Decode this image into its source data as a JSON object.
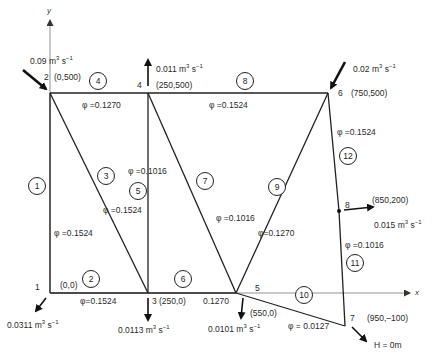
{
  "axes": {
    "x_label": "x",
    "y_label": "y"
  },
  "nodes": [
    {
      "id": "1",
      "coords": "(0,0)"
    },
    {
      "id": "2",
      "coords": "(0,500)"
    },
    {
      "id": "3",
      "coords": "(250,0)"
    },
    {
      "id": "4",
      "coords": "(250,500)"
    },
    {
      "id": "5",
      "coords": "(550,0)"
    },
    {
      "id": "6",
      "coords": "(750,500)"
    },
    {
      "id": "7",
      "coords": "(950,–100)"
    },
    {
      "id": "8",
      "coords": "(850,200)"
    }
  ],
  "pipes": [
    {
      "id": "1",
      "diameter": "φ =0.1524"
    },
    {
      "id": "2",
      "diameter": "φ=0.1524"
    },
    {
      "id": "3",
      "diameter": "φ =0.1524"
    },
    {
      "id": "4",
      "diameter": "φ =0.1270"
    },
    {
      "id": "5",
      "diameter": "φ =0.1016"
    },
    {
      "id": "6",
      "diameter": "0.1270"
    },
    {
      "id": "7",
      "diameter": "φ =0.1016"
    },
    {
      "id": "8",
      "diameter": "φ =0.1524"
    },
    {
      "id": "9",
      "diameter": "φ=0.1270"
    },
    {
      "id": "10",
      "diameter": "φ = 0.0127"
    },
    {
      "id": "11",
      "diameter": "φ =0.1016"
    },
    {
      "id": "12",
      "diameter": "φ =0.1524"
    }
  ],
  "flows": {
    "node2_in": {
      "value": "0.09 m",
      "unit_tail": " s",
      "exp1": "3",
      "exp2": "−1"
    },
    "node4_out": {
      "value": "0.011 m",
      "unit_tail": " s",
      "exp1": "3",
      "exp2": "−1"
    },
    "node6_in": {
      "value": "0.02 m",
      "unit_tail": " s",
      "exp1": "3",
      "exp2": "−1"
    },
    "node8_out": {
      "value": "0.015 m",
      "unit_tail": " s",
      "exp1": "3",
      "exp2": "−1"
    },
    "node1_out": {
      "value": "0.0311 m",
      "unit_tail": " s",
      "exp1": "3",
      "exp2": "−1"
    },
    "node3_out": {
      "value": "0.0113 m",
      "unit_tail": " s",
      "exp1": "3",
      "exp2": "−1"
    },
    "node5_out": {
      "value": "0.0101 m",
      "unit_tail": " s",
      "exp1": "3",
      "exp2": "−1"
    }
  },
  "boundary": {
    "node7_head": "H = 0m"
  },
  "colors": {
    "line": "#222222",
    "text": "#2a2a2a",
    "axis": "#555555"
  }
}
